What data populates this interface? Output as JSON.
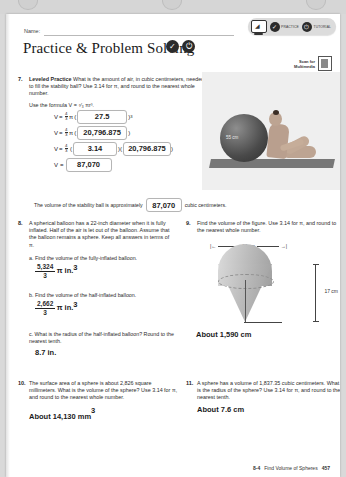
{
  "header": {
    "name_label": "Name:",
    "title": "Practice & Problem Solving",
    "icon_check": "✓",
    "icon_power": "⏻",
    "scan_for_line1": "Scan for",
    "scan_for_line2": "Multimedia",
    "toolbar": {
      "screen_icon": "laptop-wifi",
      "practice_label": "PRACTICE",
      "tutorial_label": "TUTORIAL"
    }
  },
  "problem7": {
    "number": "7.",
    "lead": "Leveled Practice",
    "text": "What is the amount of air, in cubic centimeters, needed to fill the stability ball? Use 3.14 for π, and round to the nearest whole number.",
    "formula_intro": "Use the formula V = ⁴⁄₃ πr³.",
    "V": "V",
    "eq": "=",
    "frac_num": "4",
    "frac_den": "3",
    "pi": "π",
    "line1_answer": "27.5",
    "line1_exp": "3",
    "line2_answer": "20,796.875",
    "line3_answer": "3.14",
    "line3_tail": "20,796.875",
    "line4_answer": "87,070",
    "conclusion_pre": "The volume of the stability ball is approximately",
    "conclusion_answer": "87,070",
    "conclusion_post": "cubic centimeters.",
    "photo_label": "55 cm"
  },
  "problem8": {
    "number": "8.",
    "text": "A spherical balloon has a 22-inch diameter when it is fully inflated. Half of the air is let out of the balloon. Assume that the balloon remains a sphere. Keep all answers in terms of π.",
    "part_a_label": "a.",
    "part_a_text": "Find the volume of the fully-inflated balloon.",
    "part_a_num": "5,324",
    "part_a_den": "3",
    "part_a_unit": "π in.",
    "part_a_exp": "3",
    "part_b_label": "b.",
    "part_b_text": "Find the volume of the half-inflated balloon.",
    "part_b_num": "2,662",
    "part_b_den": "3",
    "part_b_unit": "π in.",
    "part_b_exp": "3",
    "part_c_label": "c.",
    "part_c_text": "What is the radius of the half-inflated balloon? Round to the nearest tenth.",
    "part_c_answer": "8.7 in."
  },
  "problem9": {
    "number": "9.",
    "text": "Find the volume of the figure. Use 3.14 for π, and round to the nearest whole number.",
    "dim_width": "14 cm",
    "dim_height": "17 cm",
    "answer": "About 1,590 cm"
  },
  "problem10": {
    "number": "10.",
    "text": "The surface area of a sphere is about 2,826 square millimeters. What is the volume of the sphere? Use 3.14 for π, and round to the nearest whole number.",
    "answer": "About 14,130 mm",
    "answer_exp": "3"
  },
  "problem11": {
    "number": "11.",
    "text": "A sphere has a volume of 1,837.35 cubic centimeters. What is the radius of the sphere? Use 3.14 for π, and round to the nearest tenth.",
    "answer": "About 7.6 cm"
  },
  "footer": {
    "lesson": "8-4",
    "title": "Find Volume of Spheres",
    "page": "457"
  }
}
